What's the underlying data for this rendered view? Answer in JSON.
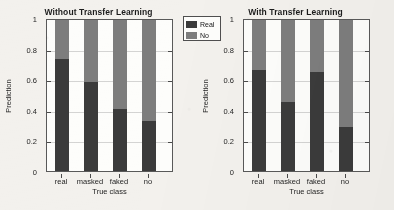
{
  "chart_data": {
    "type": "bar",
    "subtype": "stacked-bar",
    "title": "",
    "panels": [
      {
        "title": "Without Transfer Learning",
        "categories": [
          "real",
          "masked",
          "faked",
          "no"
        ],
        "series": [
          {
            "name": "Real",
            "color": "#3b3b3b",
            "values": [
              0.74,
              0.59,
              0.41,
              0.33
            ]
          },
          {
            "name": "No",
            "color": "#7d7d7d",
            "values": [
              0.26,
              0.41,
              0.59,
              0.67
            ]
          }
        ]
      },
      {
        "title": "With Transfer Learning",
        "categories": [
          "real",
          "masked",
          "faked",
          "no"
        ],
        "series": [
          {
            "name": "Real",
            "color": "#3b3b3b",
            "values": [
              0.67,
              0.455,
              0.655,
              0.29
            ]
          },
          {
            "name": "No",
            "color": "#7d7d7d",
            "values": [
              0.33,
              0.545,
              0.345,
              0.71
            ]
          }
        ]
      }
    ],
    "xlabel": "True class",
    "ylabel": "Prediction",
    "ylim": [
      0,
      1
    ],
    "yticks": [
      "0",
      "0.2",
      "0.4",
      "0.6",
      "0.8",
      "1"
    ],
    "ytick_values": [
      0,
      0.2,
      0.4,
      0.6,
      0.8,
      1
    ],
    "grid": true,
    "legend": {
      "position": "top-right",
      "entries": [
        {
          "label": "Real",
          "color": "#3b3b3b"
        },
        {
          "label": "No",
          "color": "#7d7d7d"
        }
      ]
    }
  },
  "colors": {
    "real": "#3b3b3b",
    "no": "#7d7d7d",
    "background": "#f3f1ed",
    "plot_background": "#fdfdfb",
    "axis": "#595959"
  }
}
